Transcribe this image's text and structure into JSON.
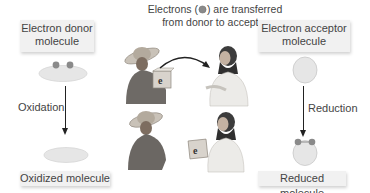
{
  "title": {
    "line1_prefix": "Electrons (",
    "line1_suffix": ") are transferred",
    "line2": "from donor to acceptor",
    "electron_icon": "electron-dot-icon"
  },
  "donor": {
    "label_line1": "Electron donor",
    "label_line2": "molecule",
    "process_label": "Oxidation",
    "result_label": "Oxidized molecule"
  },
  "acceptor": {
    "label_line1": "Electron acceptor",
    "label_line2": "molecule",
    "process_label": "Reduction",
    "result_label": "Reduced molecule"
  },
  "illustration": {
    "box_symbol_top": "e",
    "box_symbol_bottom": "e",
    "superscript": "−"
  },
  "colors": {
    "molecule_fill": "#e6e6e6",
    "electron": "#8a8a8a",
    "label_bg": "#f1f1f1",
    "arrow": "#222222"
  }
}
